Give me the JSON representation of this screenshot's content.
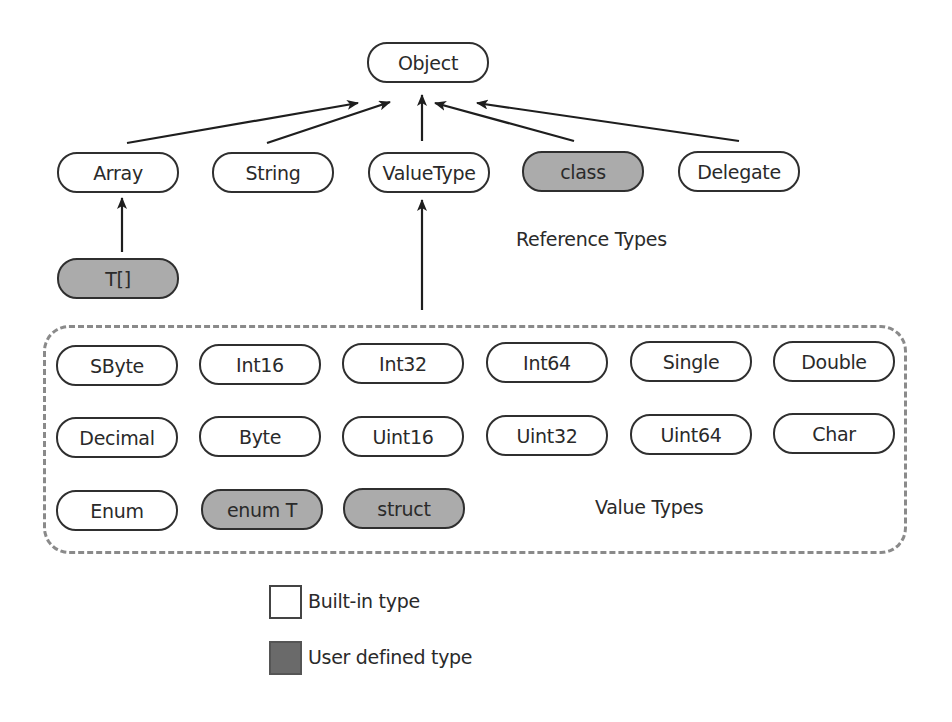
{
  "root": {
    "label": "Object",
    "kind": "built-in"
  },
  "reference_row": [
    {
      "label": "Array",
      "kind": "built-in"
    },
    {
      "label": "String",
      "kind": "built-in"
    },
    {
      "label": "ValueType",
      "kind": "built-in"
    },
    {
      "label": "class",
      "kind": "user-defined"
    },
    {
      "label": "Delegate",
      "kind": "built-in"
    }
  ],
  "array_child": {
    "label": "T[]",
    "kind": "user-defined"
  },
  "reference_types_label": "Reference Types",
  "value_types": {
    "label": "Value Types",
    "rows": [
      [
        {
          "label": "SByte",
          "kind": "built-in"
        },
        {
          "label": "Int16",
          "kind": "built-in"
        },
        {
          "label": "Int32",
          "kind": "built-in"
        },
        {
          "label": "Int64",
          "kind": "built-in"
        },
        {
          "label": "Single",
          "kind": "built-in"
        },
        {
          "label": "Double",
          "kind": "built-in"
        }
      ],
      [
        {
          "label": "Decimal",
          "kind": "built-in"
        },
        {
          "label": "Byte",
          "kind": "built-in"
        },
        {
          "label": "Uint16",
          "kind": "built-in"
        },
        {
          "label": "Uint32",
          "kind": "built-in"
        },
        {
          "label": "Uint64",
          "kind": "built-in"
        },
        {
          "label": "Char",
          "kind": "built-in"
        }
      ],
      [
        {
          "label": "Enum",
          "kind": "built-in"
        },
        {
          "label": "enum T",
          "kind": "user-defined"
        },
        {
          "label": "struct",
          "kind": "user-defined"
        }
      ]
    ]
  },
  "legend": {
    "builtin": {
      "label": "Built-in type",
      "color": "#ffffff"
    },
    "user": {
      "label": "User defined type",
      "color": "#6a6a6a"
    }
  },
  "colors": {
    "user_node_fill": "#ababab",
    "stroke": "#2f2f2f",
    "dash": "#8a8a8a"
  }
}
